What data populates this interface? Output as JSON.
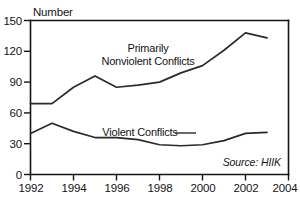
{
  "chart_data": {
    "type": "line",
    "title": "",
    "subtitle": "",
    "xlabel": "",
    "ylabel": "Number",
    "xlim": [
      1992,
      2004
    ],
    "ylim": [
      0,
      150
    ],
    "ytick_labels": [
      "0",
      "30",
      "60",
      "90",
      "120",
      "150"
    ],
    "yticks": [
      0,
      30,
      60,
      90,
      120,
      150
    ],
    "xtick_labels": [
      "1992",
      "1994",
      "1996",
      "1998",
      "2000",
      "2002",
      "2004"
    ],
    "xticks": [
      1992,
      1994,
      1996,
      1998,
      2000,
      2002,
      2004
    ],
    "grid": false,
    "legend_position": "inline-annotations",
    "x": [
      1992,
      1993,
      1994,
      1995,
      1996,
      1997,
      1998,
      1999,
      2000,
      2001,
      2002,
      2003
    ],
    "series": [
      {
        "name": "Primarily Nonviolent Conflicts",
        "label_line1": "Primarily",
        "label_line2": "Nonviolent Conflicts",
        "values": [
          69,
          69,
          85,
          96,
          85,
          87,
          90,
          99,
          106,
          121,
          138,
          133
        ]
      },
      {
        "name": "Violent Conflicts",
        "label_line1": "Violent Conflicts",
        "label_line2": "",
        "values": [
          40,
          50,
          42,
          36,
          36,
          34,
          29,
          28,
          29,
          33,
          40,
          41
        ]
      }
    ],
    "annotations": [
      {
        "name": "source-note",
        "text": "Source: HIIK"
      }
    ]
  }
}
